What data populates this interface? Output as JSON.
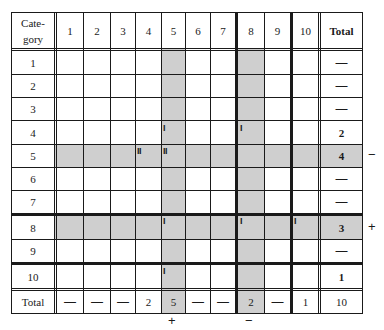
{
  "table": {
    "header": {
      "category_label_line1": "Cate-",
      "category_label_line2": "gory",
      "columns": [
        "1",
        "2",
        "3",
        "4",
        "5",
        "6",
        "7",
        "8",
        "9",
        "10"
      ],
      "total_label": "Total"
    },
    "rows": [
      {
        "label": "1",
        "total": "—"
      },
      {
        "label": "2",
        "total": "—"
      },
      {
        "label": "3",
        "total": "—"
      },
      {
        "label": "4",
        "total": "2"
      },
      {
        "label": "5",
        "total": "4"
      },
      {
        "label": "6",
        "total": "—"
      },
      {
        "label": "7",
        "total": "—"
      },
      {
        "label": "8",
        "total": "3"
      },
      {
        "label": "9",
        "total": "—"
      },
      {
        "label": "10",
        "total": "1"
      }
    ],
    "totals_row": {
      "label": "Total",
      "values": [
        "—",
        "—",
        "—",
        "2",
        "5",
        "—",
        "—",
        "2",
        "—",
        "1"
      ],
      "grand_total": "10"
    },
    "tallies": [
      {
        "row": 4,
        "col": 5,
        "mark": "I"
      },
      {
        "row": 4,
        "col": 8,
        "mark": "I"
      },
      {
        "row": 5,
        "col": 4,
        "mark": "II"
      },
      {
        "row": 5,
        "col": 5,
        "mark": "II"
      },
      {
        "row": 8,
        "col": 5,
        "mark": "I"
      },
      {
        "row": 8,
        "col": 8,
        "mark": "I"
      },
      {
        "row": 8,
        "col": 10,
        "mark": "I"
      },
      {
        "row": 10,
        "col": 5,
        "mark": "I"
      }
    ],
    "shaded_rows": [
      5,
      8
    ],
    "shaded_columns": [
      5,
      8
    ],
    "row_side_marks": [
      {
        "row": 5,
        "mark": "−"
      },
      {
        "row": 8,
        "mark": "+"
      }
    ],
    "column_bottom_marks": [
      {
        "col": 5,
        "mark": "+"
      },
      {
        "col": 8,
        "mark": "−"
      }
    ],
    "colors": {
      "shade": "#cfcfcf",
      "line": "#1a1a1a",
      "background": "#ffffff"
    }
  }
}
